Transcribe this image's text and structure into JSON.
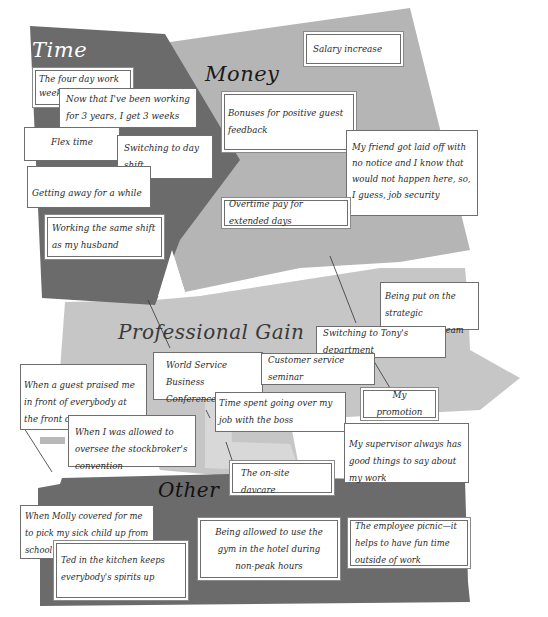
{
  "diagram": {
    "categories": [
      {
        "id": "time",
        "title": "Time",
        "color": "#6b6b6b",
        "title_color": "#ffffff",
        "items": [
          "The four day work week",
          "Now that I've been working for 3 years, I get 3 weeks vacation",
          "Flex time",
          "Switching to day shift",
          "Getting away for a while",
          "Working the same shift as my husband"
        ]
      },
      {
        "id": "money",
        "title": "Money",
        "color": "#b4b4b4",
        "title_color": "#1a1a1a",
        "items": [
          "Salary increase",
          "Bonuses for positive guest feedback",
          "My friend got laid off with no notice and I know that would not happen here, so, I guess, job security",
          "Overtime pay for extended days"
        ]
      },
      {
        "id": "professional_gain",
        "title": "Professional Gain",
        "color": "#c4c4c4",
        "title_color": "#3a3a3a",
        "items": [
          "Being put on the strategic development team",
          "Switching to Tony's department",
          "World Service Business Conference",
          "Customer service seminar",
          "When a guest praised me in front of everybody at the front desk",
          "Time spent going over my job with the boss",
          "My promotion",
          "When I was allowed to oversee the stockbroker's convention",
          "My supervisor always has good things to say about my work"
        ]
      },
      {
        "id": "other",
        "title": "Other",
        "color": "#6b6b6b",
        "title_color": "#111111",
        "items": [
          "The on-site daycare",
          "When Molly covered for me to pick my sick child up from school",
          "Ted in the kitchen keeps everybody's spirits up",
          "Being allowed to use the gym in the hotel during non-peak hours",
          "The employee picnic—it helps to have fun time outside of work"
        ]
      }
    ]
  }
}
